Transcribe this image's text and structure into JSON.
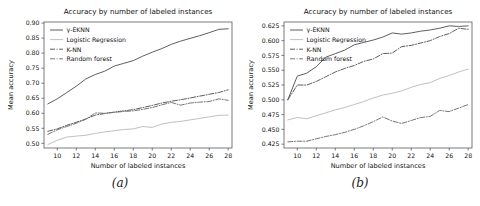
{
  "figure": {
    "panels": [
      {
        "caption": "(a)",
        "title": "Accuracy by number of labeled instances",
        "xlabel": "Number of labeled instances",
        "ylabel": "Mean accuracy"
      },
      {
        "caption": "(b)",
        "title": "Accuracy by number of labeled instances",
        "xlabel": "Number of labeled instances",
        "ylabel": "Mean accuracy"
      }
    ]
  },
  "chart_data": [
    {
      "type": "line",
      "panel": "(a)",
      "title": "Accuracy by number of labeled instances",
      "xlabel": "Number of labeled instances",
      "ylabel": "Mean accuracy",
      "xlim": [
        8.6,
        28.4
      ],
      "ylim": [
        0.4845,
        0.9035
      ],
      "xticks": [
        10,
        12,
        14,
        16,
        18,
        20,
        22,
        24,
        26,
        28
      ],
      "yticks": [
        0.5,
        0.55,
        0.6,
        0.65,
        0.7,
        0.75,
        0.8,
        0.85,
        0.9
      ],
      "xtick_labels": [
        "10",
        "12",
        "14",
        "16",
        "18",
        "20",
        "22",
        "24",
        "26",
        "28"
      ],
      "ytick_labels": [
        "0.50",
        "0.55",
        "0.60",
        "0.65",
        "0.70",
        "0.75",
        "0.80",
        "0.85",
        "0.90"
      ],
      "grid": false,
      "legend_position": "upper left",
      "x": [
        9,
        10,
        11,
        12,
        13,
        14,
        15,
        16,
        17,
        18,
        19,
        20,
        21,
        22,
        23,
        24,
        25,
        26,
        27,
        28
      ],
      "series": [
        {
          "name": "γ-EKNN",
          "style": "solid",
          "color": "#555555",
          "values": [
            0.631,
            0.648,
            0.669,
            0.69,
            0.714,
            0.729,
            0.74,
            0.757,
            0.766,
            0.775,
            0.79,
            0.803,
            0.815,
            0.829,
            0.84,
            0.849,
            0.858,
            0.868,
            0.879,
            0.881
          ]
        },
        {
          "name": "Logistic Regression",
          "style": "solid",
          "color": "#bdbdbd",
          "values": [
            0.496,
            0.51,
            0.521,
            0.524,
            0.527,
            0.533,
            0.538,
            0.542,
            0.546,
            0.548,
            0.556,
            0.553,
            0.564,
            0.57,
            0.573,
            0.578,
            0.583,
            0.588,
            0.593,
            0.594
          ]
        },
        {
          "name": "K-NN",
          "style": "dashdot",
          "color": "#555555",
          "values": [
            0.54,
            0.548,
            0.56,
            0.57,
            0.581,
            0.594,
            0.599,
            0.604,
            0.608,
            0.612,
            0.619,
            0.626,
            0.634,
            0.64,
            0.645,
            0.651,
            0.657,
            0.663,
            0.669,
            0.678
          ]
        },
        {
          "name": "Random forest",
          "style": "dashdot",
          "color": "#6e6e6e",
          "values": [
            0.53,
            0.545,
            0.556,
            0.567,
            0.58,
            0.601,
            0.6,
            0.603,
            0.606,
            0.608,
            0.613,
            0.619,
            0.628,
            0.636,
            0.627,
            0.634,
            0.637,
            0.639,
            0.648,
            0.643
          ]
        }
      ]
    },
    {
      "type": "line",
      "panel": "(b)",
      "title": "Accuracy by number of labeled instances",
      "xlabel": "Number of labeled instances",
      "ylabel": "Mean accuracy",
      "xlim": [
        8.6,
        28.4
      ],
      "ylim": [
        0.4185,
        0.6315
      ],
      "xticks": [
        10,
        12,
        14,
        16,
        18,
        20,
        22,
        24,
        26,
        28
      ],
      "yticks": [
        0.425,
        0.45,
        0.475,
        0.5,
        0.525,
        0.55,
        0.575,
        0.6,
        0.625
      ],
      "xtick_labels": [
        "10",
        "12",
        "14",
        "16",
        "18",
        "20",
        "22",
        "24",
        "26",
        "28"
      ],
      "ytick_labels": [
        "0.425",
        "0.450",
        "0.475",
        "0.500",
        "0.525",
        "0.550",
        "0.575",
        "0.600",
        "0.625"
      ],
      "grid": false,
      "legend_position": "upper left",
      "x": [
        9,
        10,
        11,
        12,
        13,
        14,
        15,
        16,
        17,
        18,
        19,
        20,
        21,
        22,
        23,
        24,
        25,
        26,
        27,
        28
      ],
      "series": [
        {
          "name": "γ-EKNN",
          "style": "solid",
          "color": "#555555",
          "values": [
            0.5,
            0.54,
            0.545,
            0.556,
            0.572,
            0.578,
            0.584,
            0.593,
            0.597,
            0.601,
            0.606,
            0.613,
            0.611,
            0.613,
            0.616,
            0.618,
            0.621,
            0.625,
            0.624,
            0.625
          ]
        },
        {
          "name": "Logistic Regression",
          "style": "solid",
          "color": "#bdbdbd",
          "values": [
            0.466,
            0.47,
            0.468,
            0.473,
            0.478,
            0.483,
            0.487,
            0.492,
            0.497,
            0.503,
            0.508,
            0.511,
            0.515,
            0.521,
            0.526,
            0.529,
            0.536,
            0.541,
            0.547,
            0.552
          ]
        },
        {
          "name": "K-NN",
          "style": "dashdot",
          "color": "#555555",
          "values": [
            0.5,
            0.525,
            0.525,
            0.531,
            0.539,
            0.547,
            0.553,
            0.558,
            0.565,
            0.569,
            0.578,
            0.579,
            0.59,
            0.592,
            0.596,
            0.6,
            0.607,
            0.612,
            0.621,
            0.619
          ]
        },
        {
          "name": "Random forest",
          "style": "dashdot",
          "color": "#6e6e6e",
          "values": [
            0.429,
            0.43,
            0.43,
            0.434,
            0.438,
            0.441,
            0.445,
            0.45,
            0.456,
            0.463,
            0.471,
            0.464,
            0.46,
            0.465,
            0.47,
            0.472,
            0.482,
            0.48,
            0.486,
            0.492
          ]
        }
      ]
    }
  ]
}
